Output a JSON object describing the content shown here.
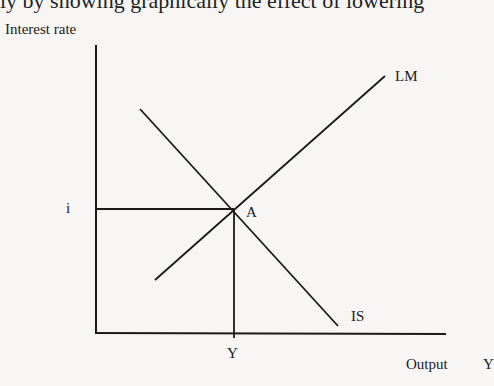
{
  "header_fragment": "ly by showing graphically the effect of lowering",
  "diagram": {
    "type": "IS-LM",
    "y_axis_label": "Interest rate",
    "x_axis_label": "Output",
    "x_axis_symbol": "Y",
    "curves": [
      {
        "name": "LM",
        "label": "LM",
        "slope": "upward"
      },
      {
        "name": "IS",
        "label": "IS",
        "slope": "downward"
      }
    ],
    "equilibrium": {
      "label": "A",
      "interest_label": "i",
      "output_label": "Y"
    }
  },
  "colors": {
    "background": "#f7f6f4",
    "ink": "#1a1a1a"
  }
}
